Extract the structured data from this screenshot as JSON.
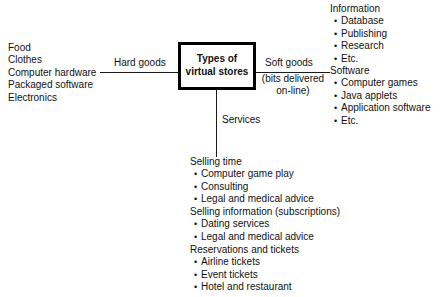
{
  "diagram": {
    "center_node": {
      "line1": "Types of",
      "line2": "virtual stores"
    },
    "branches": {
      "hard_goods": {
        "label": "Hard goods",
        "items": [
          "Food",
          "Clothes",
          "Computer hardware",
          "Packaged software",
          "Electronics"
        ]
      },
      "soft_goods": {
        "label": "Soft goods",
        "sublabel_line1": "(bits delivered",
        "sublabel_line2": "on-line)",
        "groups": [
          {
            "heading": "Information",
            "items": [
              "Database",
              "Publishing",
              "Research",
              "Etc."
            ]
          },
          {
            "heading": "Software",
            "items": [
              "Computer games",
              "Java applets",
              "Application software",
              "Etc."
            ]
          }
        ]
      },
      "services": {
        "label": "Services",
        "groups": [
          {
            "heading": "Selling time",
            "items": [
              "Computer game play",
              "Consulting",
              "Legal and medical advice"
            ]
          },
          {
            "heading": "Selling information (subscriptions)",
            "items": [
              "Dating services",
              "Legal and medical advice"
            ]
          },
          {
            "heading": "Reservations and tickets",
            "items": [
              "Airline tickets",
              "Event tickets",
              "Hotel and restaurant"
            ]
          }
        ]
      }
    },
    "colors": {
      "ink": "#111111",
      "line": "#1a1a1a",
      "background": "#ffffff"
    }
  }
}
